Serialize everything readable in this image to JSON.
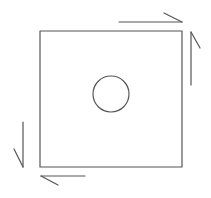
{
  "diagram": {
    "colors": {
      "stroke": "#555555",
      "background": "#ffffff"
    },
    "square": {
      "x": 40,
      "y": 31,
      "width": 142,
      "height": 136
    },
    "hole": {
      "cx": 111,
      "cy": 94,
      "r": 18
    },
    "arrows": [
      {
        "name": "top",
        "direction": "right",
        "line": [
          119,
          22,
          182,
          22
        ],
        "barb": [
          182,
          22,
          164,
          13
        ]
      },
      {
        "name": "right",
        "direction": "up",
        "line": [
          191,
          85,
          191,
          32
        ],
        "barb": [
          191,
          32,
          200,
          48
        ]
      },
      {
        "name": "bottom",
        "direction": "left",
        "line": [
          85,
          176,
          41,
          176
        ],
        "barb": [
          41,
          176,
          58,
          185
        ]
      },
      {
        "name": "left",
        "direction": "down",
        "line": [
          23,
          122,
          23,
          167
        ],
        "barb": [
          23,
          167,
          14,
          149
        ]
      }
    ]
  }
}
